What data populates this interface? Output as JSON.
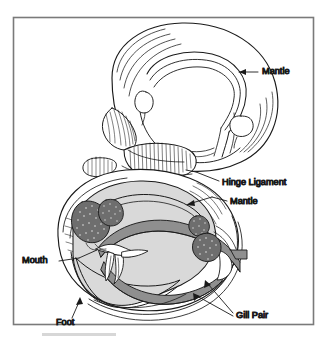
{
  "figure": {
    "border_color": "#7a7a7a",
    "background_color": "#ffffff",
    "ink_color": "#1a1a1a",
    "body_fill": "#d9d9d9",
    "gill_fill": "#8f8f8f",
    "organ_fill": "#6e6e6e",
    "shell_fill": "#ffffff",
    "artifact_color": "#c9c9c9"
  },
  "labels": [
    {
      "id": "mantle-upper",
      "text": "Mantle",
      "x": 262,
      "y": 72,
      "anchor": "start"
    },
    {
      "id": "hinge-ligament",
      "text": "Hinge Ligament",
      "x": 222,
      "y": 183,
      "anchor": "start"
    },
    {
      "id": "mantle-lower",
      "text": "Mantle",
      "x": 230,
      "y": 202,
      "anchor": "start"
    },
    {
      "id": "mouth",
      "text": "Mouth",
      "x": 22,
      "y": 261,
      "anchor": "start"
    },
    {
      "id": "foot",
      "text": "Foot",
      "x": 56,
      "y": 323,
      "anchor": "start"
    },
    {
      "id": "gill-pair",
      "text": "Gill Pair",
      "x": 236,
      "y": 316,
      "anchor": "start"
    }
  ]
}
